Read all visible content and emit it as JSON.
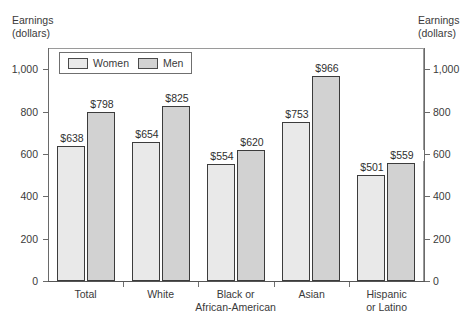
{
  "chart_data": {
    "type": "bar",
    "title": "",
    "subtitle": "",
    "xlabel": "",
    "ylabel": "Earnings (dollars)",
    "ylabel_left_line1": "Earnings",
    "ylabel_left_line2": "(dollars)",
    "ylabel_right_line1": "Earnings",
    "ylabel_right_line2": "(dollars)",
    "ylim": [
      0,
      1100
    ],
    "yticks": [
      0,
      200,
      400,
      600,
      800,
      1000
    ],
    "ytick_labels": [
      "0",
      "200",
      "400",
      "600",
      "800",
      "1,000"
    ],
    "grid": false,
    "legend_position": "top-left-inside",
    "categories": [
      "Total",
      "White",
      "Black or African-American",
      "Asian",
      "Hispanic or Latino"
    ],
    "category_label_lines": [
      [
        "Total"
      ],
      [
        "White"
      ],
      [
        "Black or",
        "African-American"
      ],
      [
        "Asian"
      ],
      [
        "Hispanic",
        "or Latino"
      ]
    ],
    "series": [
      {
        "name": "Women",
        "color": "#e9e9e9",
        "values": [
          638,
          654,
          554,
          753,
          501
        ],
        "labels": [
          "$638",
          "$654",
          "$554",
          "$753",
          "$501"
        ]
      },
      {
        "name": "Men",
        "color": "#d2d2d2",
        "values": [
          798,
          825,
          620,
          966,
          559
        ],
        "labels": [
          "$798",
          "$825",
          "$620",
          "$966",
          "$559"
        ]
      }
    ],
    "legend": [
      {
        "label": "Women",
        "color": "#e9e9e9"
      },
      {
        "label": "Men",
        "color": "#d2d2d2"
      }
    ]
  },
  "colors": {
    "background": "#ffffff",
    "frame": "#9a9a9a",
    "axis": "#6a6a6a",
    "bar_outline": "#3c3c3c",
    "text": "#3a3a3a",
    "women_fill": "#e9e9e9",
    "men_fill": "#d2d2d2"
  }
}
